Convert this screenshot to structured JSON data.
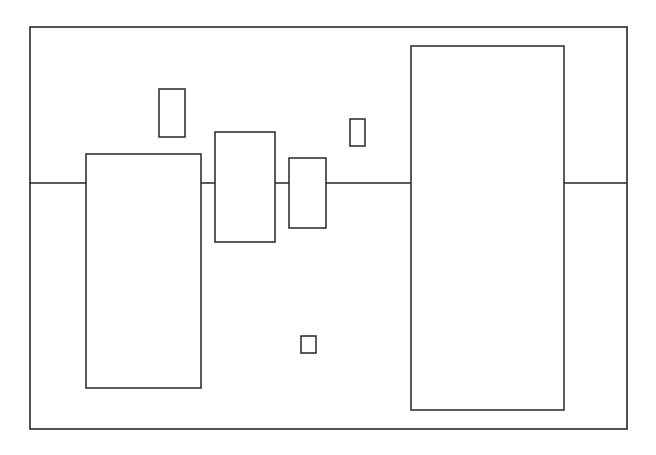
{
  "figure": {
    "title": "",
    "background_color": "#ffffff",
    "line_color": "#262626",
    "fill_color": "#ffffff",
    "width": 656,
    "height": 455
  },
  "frame": {
    "name": "outer-plot-frame",
    "x": 30,
    "y": 27,
    "width": 597,
    "height": 402,
    "stroke_width": 1.6
  },
  "baseline": {
    "name": "horizontal-baseline",
    "x1": 30,
    "x2": 627,
    "y": 183,
    "stroke_width": 1.6
  },
  "chart_data": {
    "type": "bar",
    "title": "",
    "subtitle": "",
    "xlabel": "",
    "ylabel": "",
    "grid": false,
    "legend": null,
    "axis_ranges": {
      "x": [
        30,
        627
      ],
      "y": [
        27,
        429
      ]
    },
    "baseline_value": 183,
    "note": "Rectangles of varying width and height straddling a single horizontal baseline; all outlined, unfilled (white). Values given as pixel-space box bounds (x=left, y=top, w=width, h=height) relative to the outer frame.",
    "categories": [
      "box-1",
      "box-2",
      "box-3",
      "box-4",
      "box-5",
      "box-6",
      "box-7"
    ],
    "boxes": [
      {
        "id": "box-1",
        "label": "",
        "x": 86,
        "y": 154,
        "w": 115,
        "h": 234,
        "above_baseline": 29,
        "below_baseline": 205,
        "crosses_baseline": true
      },
      {
        "id": "box-2",
        "label": "",
        "x": 159,
        "y": 89,
        "w": 26,
        "h": 48,
        "above_baseline": 48,
        "below_baseline": 0,
        "crosses_baseline": false
      },
      {
        "id": "box-3",
        "label": "",
        "x": 215,
        "y": 132,
        "w": 60,
        "h": 110,
        "above_baseline": 51,
        "below_baseline": 59,
        "crosses_baseline": true
      },
      {
        "id": "box-4",
        "label": "",
        "x": 289,
        "y": 158,
        "w": 37,
        "h": 70,
        "above_baseline": 25,
        "below_baseline": 45,
        "crosses_baseline": true
      },
      {
        "id": "box-5",
        "label": "",
        "x": 350,
        "y": 119,
        "w": 15,
        "h": 27,
        "above_baseline": 27,
        "below_baseline": 0,
        "crosses_baseline": false
      },
      {
        "id": "box-6",
        "label": "",
        "x": 411,
        "y": 46,
        "w": 153,
        "h": 364,
        "above_baseline": 137,
        "below_baseline": 227,
        "crosses_baseline": true
      },
      {
        "id": "box-7",
        "label": "",
        "x": 301,
        "y": 336,
        "w": 15,
        "h": 17,
        "above_baseline": 0,
        "below_baseline": 17,
        "crosses_baseline": false
      }
    ],
    "values": [
      234,
      48,
      110,
      70,
      27,
      364,
      17
    ]
  }
}
